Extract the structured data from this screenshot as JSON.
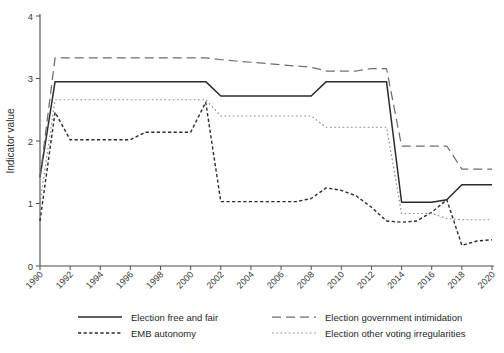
{
  "chart_data": {
    "type": "line",
    "title": "",
    "xlabel": "",
    "ylabel": "Indicator value",
    "xlim": [
      1990,
      2020
    ],
    "ylim": [
      0,
      4
    ],
    "grid": false,
    "legend_position": "bottom",
    "x_ticks": [
      1990,
      1992,
      1994,
      1996,
      1998,
      2000,
      2002,
      2004,
      2006,
      2008,
      2010,
      2012,
      2014,
      2016,
      2018,
      2020
    ],
    "y_ticks": [
      0,
      1,
      2,
      3,
      4
    ],
    "x": [
      1990,
      1991,
      1992,
      1993,
      1994,
      1995,
      1996,
      1997,
      1998,
      1999,
      2000,
      2001,
      2002,
      2003,
      2004,
      2005,
      2006,
      2007,
      2008,
      2009,
      2010,
      2011,
      2012,
      2013,
      2014,
      2015,
      2016,
      2017,
      2018,
      2019,
      2020
    ],
    "series": [
      {
        "name": "Election free and fair",
        "style": "solid",
        "color": "#2b2b2b",
        "values": [
          1.42,
          2.95,
          2.95,
          2.95,
          2.95,
          2.95,
          2.95,
          2.95,
          2.95,
          2.95,
          2.95,
          2.95,
          2.72,
          2.72,
          2.72,
          2.72,
          2.72,
          2.72,
          2.72,
          2.95,
          2.95,
          2.95,
          2.95,
          2.95,
          1.02,
          1.02,
          1.02,
          1.06,
          1.3,
          1.3,
          1.3
        ]
      },
      {
        "name": "Election government intimidation",
        "style": "long-dash",
        "color": "#6e6e6e",
        "values": [
          1.42,
          3.33,
          3.33,
          3.33,
          3.33,
          3.33,
          3.33,
          3.33,
          3.33,
          3.33,
          3.33,
          3.33,
          3.3,
          3.28,
          3.26,
          3.24,
          3.22,
          3.2,
          3.18,
          3.12,
          3.12,
          3.12,
          3.16,
          3.16,
          1.92,
          1.92,
          1.92,
          1.92,
          1.55,
          1.55,
          1.55
        ]
      },
      {
        "name": "EMB autonomy",
        "style": "dotted",
        "color": "#2b2b2b",
        "values": [
          0.72,
          2.46,
          2.02,
          2.02,
          2.02,
          2.02,
          2.02,
          2.14,
          2.14,
          2.14,
          2.14,
          2.62,
          1.03,
          1.03,
          1.03,
          1.03,
          1.03,
          1.03,
          1.08,
          1.25,
          1.21,
          1.12,
          0.94,
          0.72,
          0.7,
          0.72,
          0.86,
          1.06,
          0.33,
          0.4,
          0.42
        ]
      },
      {
        "name": "Election other voting irregularities",
        "style": "fine-dot",
        "color": "#8a8a8a",
        "values": [
          1.0,
          2.66,
          2.66,
          2.66,
          2.66,
          2.66,
          2.66,
          2.66,
          2.66,
          2.66,
          2.66,
          2.66,
          2.4,
          2.4,
          2.4,
          2.4,
          2.4,
          2.4,
          2.4,
          2.22,
          2.22,
          2.22,
          2.22,
          2.22,
          0.84,
          0.84,
          0.84,
          0.76,
          0.74,
          0.74,
          0.74
        ]
      }
    ]
  },
  "legend": {
    "entries": [
      {
        "label": "Election free and fair",
        "style": "solid"
      },
      {
        "label": "Election government intimidation",
        "style": "long-dash"
      },
      {
        "label": "EMB autonomy",
        "style": "dotted"
      },
      {
        "label": "Election other voting irregularities",
        "style": "fine-dot"
      }
    ]
  }
}
